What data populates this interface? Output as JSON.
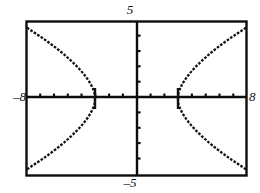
{
  "figure": {
    "kind": "graphing-calculator-screen",
    "background_color": "#ffffff",
    "ink_color": "#000000",
    "frame": {
      "left": 26,
      "top": 21,
      "right": 247,
      "bottom": 176
    }
  },
  "labels": {
    "x_min": "–8",
    "x_max": "8",
    "y_max": "5",
    "y_min": "–5"
  },
  "chart_data": {
    "type": "scatter",
    "title": "",
    "xlabel": "",
    "ylabel": "",
    "xlim": [
      -8,
      8
    ],
    "ylim": [
      -5,
      5
    ],
    "grid": false,
    "legend": null,
    "axes": {
      "x_axis_at_y": 0,
      "y_axis_at_x": 0,
      "x_tick_interval": 1,
      "y_tick_interval": 1,
      "x_tick_values": [
        -7,
        -6,
        -5,
        -4,
        -3,
        -2,
        -1,
        1,
        2,
        3,
        4,
        5,
        6,
        7
      ],
      "y_tick_values": [
        -4,
        -3,
        -2,
        -1,
        1,
        2,
        3,
        4
      ],
      "tick_labels_shown": false
    },
    "annotations": [
      {
        "text": "5",
        "position": "top-center-outside",
        "value": 5
      },
      {
        "text": "–5",
        "position": "bottom-center-outside",
        "value": -5
      },
      {
        "text": "–8",
        "position": "left-middle-outside",
        "value": -8
      },
      {
        "text": "8",
        "position": "right-middle-outside",
        "value": 8
      }
    ],
    "series": [
      {
        "name": "hyperbola-right-branch-upper",
        "style": "dotted-pixel-trace",
        "x": [
          3.0,
          3.05,
          3.15,
          3.3,
          3.5,
          3.75,
          4.05,
          4.4,
          4.8,
          5.25,
          5.75,
          6.3,
          6.9,
          7.55,
          8.0
        ],
        "y": [
          0.0,
          0.39,
          0.63,
          0.91,
          1.2,
          1.5,
          1.82,
          2.15,
          2.49,
          2.85,
          3.21,
          3.58,
          3.96,
          4.34,
          4.62
        ]
      },
      {
        "name": "hyperbola-right-branch-lower",
        "style": "dotted-pixel-trace",
        "x": [
          3.0,
          3.05,
          3.15,
          3.3,
          3.5,
          3.75,
          4.05,
          4.4,
          4.8,
          5.25,
          5.75,
          6.3,
          6.9,
          7.55,
          8.0
        ],
        "y": [
          0.0,
          -0.39,
          -0.63,
          -0.91,
          -1.2,
          -1.5,
          -1.82,
          -2.15,
          -2.49,
          -2.85,
          -3.21,
          -3.58,
          -3.96,
          -4.34,
          -4.62
        ]
      },
      {
        "name": "hyperbola-left-branch-upper",
        "style": "dotted-pixel-trace",
        "x": [
          -3.0,
          -3.05,
          -3.15,
          -3.3,
          -3.5,
          -3.75,
          -4.05,
          -4.4,
          -4.8,
          -5.25,
          -5.75,
          -6.3,
          -6.9,
          -7.55,
          -8.0
        ],
        "y": [
          0.0,
          0.39,
          0.63,
          0.91,
          1.2,
          1.5,
          1.82,
          2.15,
          2.49,
          2.85,
          3.21,
          3.58,
          3.96,
          4.34,
          4.62
        ]
      },
      {
        "name": "hyperbola-left-branch-lower",
        "style": "dotted-pixel-trace",
        "x": [
          -3.0,
          -3.05,
          -3.15,
          -3.3,
          -3.5,
          -3.75,
          -4.05,
          -4.4,
          -4.8,
          -5.25,
          -5.75,
          -6.3,
          -6.9,
          -7.55,
          -8.0
        ],
        "y": [
          0.0,
          -0.39,
          -0.63,
          -0.91,
          -1.2,
          -1.5,
          -1.82,
          -2.15,
          -2.49,
          -2.85,
          -3.21,
          -3.58,
          -3.96,
          -4.34,
          -4.62
        ]
      }
    ],
    "vertices": [
      {
        "x": -3,
        "y": 0
      },
      {
        "x": 3,
        "y": 0
      }
    ]
  }
}
